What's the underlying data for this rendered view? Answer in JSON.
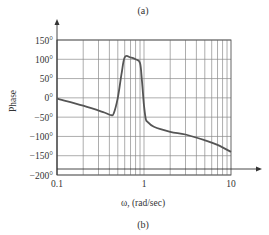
{
  "captions": {
    "top": "(a)",
    "bottom": "(b)"
  },
  "chart_data": {
    "type": "line",
    "title": "",
    "xlabel": "ω, (rad/sec)",
    "ylabel": "Phase",
    "xscale": "log",
    "xlim": [
      0.1,
      10
    ],
    "ylim": [
      -200,
      150
    ],
    "x_tick_labels": [
      "0.1",
      "1",
      "10"
    ],
    "y_tick_labels": [
      "150°",
      "100°",
      "50°",
      "0°",
      "−50°",
      "−100°",
      "−150°",
      "−200°"
    ],
    "y_ticks": [
      150,
      100,
      50,
      0,
      -50,
      -100,
      -150,
      -200
    ],
    "grid": true,
    "legend": null,
    "series": [
      {
        "name": "Phase",
        "color": "#555555",
        "x": [
          0.1,
          0.2,
          0.35,
          0.42,
          0.45,
          0.5,
          0.55,
          0.6,
          0.7,
          0.8,
          0.9,
          0.95,
          1.0,
          1.05,
          1.1,
          1.3,
          2.0,
          3.0,
          5.0,
          7.0,
          10.0
        ],
        "y": [
          -2,
          -20,
          -38,
          -45,
          -40,
          0,
          60,
          105,
          105,
          100,
          90,
          40,
          -20,
          -55,
          -62,
          -75,
          -88,
          -95,
          -110,
          -122,
          -140
        ]
      }
    ]
  }
}
